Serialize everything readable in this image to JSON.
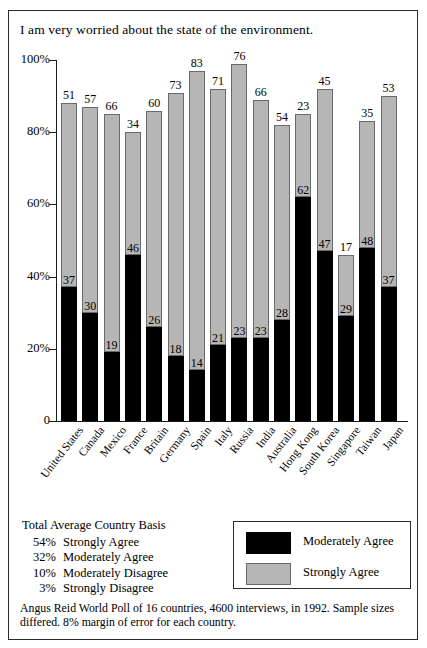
{
  "chart_data": {
    "type": "bar",
    "stacked": true,
    "title": "I am very worried about the state of the environment.",
    "xlabel": "",
    "ylabel": "",
    "ylim": [
      0,
      100
    ],
    "ytick_labels": [
      "0",
      "20%",
      "40%",
      "60%",
      "80%",
      "100%"
    ],
    "ytick_values": [
      0,
      20,
      40,
      60,
      80,
      100
    ],
    "grid": false,
    "legend_position": "bottom-right",
    "categories": [
      "United States",
      "Canada",
      "Mexico",
      "France",
      "Britain",
      "Germany",
      "Spain",
      "Italy",
      "Russia",
      "India",
      "Australia",
      "Hong Kong",
      "South Korea",
      "Singapore",
      "Taiwan",
      "Japan"
    ],
    "series": [
      {
        "name": "Moderately Agree",
        "color": "#000000",
        "values": [
          37,
          30,
          19,
          46,
          26,
          18,
          14,
          21,
          23,
          23,
          28,
          62,
          47,
          29,
          48,
          37
        ]
      },
      {
        "name": "Strongly Agree",
        "color": "#b6b6b6",
        "values": [
          51,
          57,
          66,
          34,
          60,
          73,
          83,
          71,
          76,
          66,
          54,
          23,
          45,
          17,
          35,
          53
        ]
      }
    ],
    "annotations": [
      "Total Average Country Basis",
      "54% Strongly Agree",
      "32% Moderately Agree",
      "10% Moderately Disagree",
      "3% Strongly Disagree"
    ]
  },
  "summary": {
    "heading": "Total Average Country Basis",
    "rows": [
      {
        "pct": "54%",
        "label": "Strongly Agree"
      },
      {
        "pct": "32%",
        "label": "Moderately Agree"
      },
      {
        "pct": "10%",
        "label": "Moderately Disagree"
      },
      {
        "pct": "3%",
        "label": "Strongly Disagree"
      }
    ]
  },
  "legend": {
    "items": [
      {
        "label": "Moderately Agree",
        "swatch": "black"
      },
      {
        "label": "Strongly Agree",
        "swatch": "gray"
      }
    ]
  },
  "source": {
    "line1": "Angus Reid World Poll of 16 countries, 4600 interviews, in 1992. Sample sizes",
    "line2": "differed. 8% margin of error for each country."
  }
}
